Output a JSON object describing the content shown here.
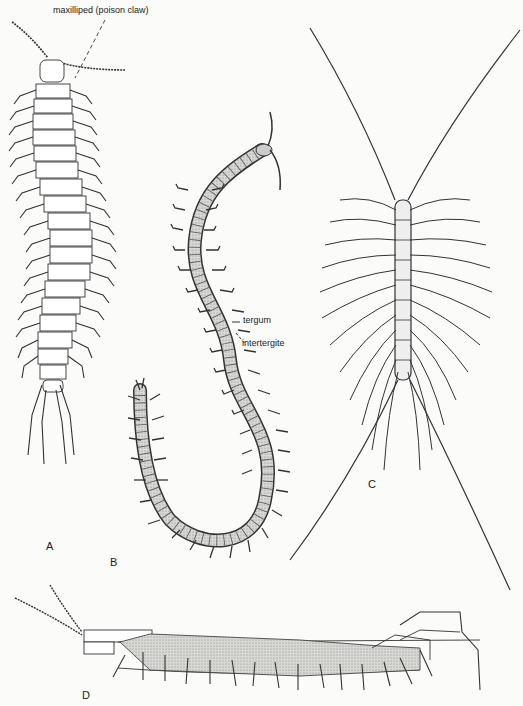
{
  "figure": {
    "panels": [
      {
        "id": "A",
        "label": "A",
        "description": "Dorsal view of centipede with long body and many leg pairs"
      },
      {
        "id": "B",
        "label": "B",
        "description": "Dorsal view of elongated soil centipede, curved S-shaped body"
      },
      {
        "id": "C",
        "label": "C",
        "description": "House centipede with very long legs and antennae"
      },
      {
        "id": "D",
        "label": "D",
        "description": "Lateral view of centipede"
      }
    ],
    "annotations": {
      "maxilliped": "maxilliped (poison claw)",
      "tergum": "tergum",
      "intertergite": "intertergite"
    },
    "colors": {
      "ink": "#222222",
      "paper": "#fbfbf9",
      "stipple": "#9a9a9a"
    }
  }
}
